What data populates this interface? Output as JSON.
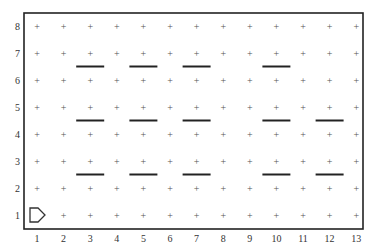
{
  "diagram": {
    "type": "grid-world",
    "columns": [
      1,
      2,
      3,
      4,
      5,
      6,
      7,
      8,
      9,
      10,
      11,
      12,
      13
    ],
    "rows": [
      1,
      2,
      3,
      4,
      5,
      6,
      7,
      8
    ],
    "grid_marker": "+",
    "colors": {
      "border": "#222222",
      "marker": "#555555",
      "wall": "#222222",
      "label": "#333333",
      "agent": "#333333",
      "background": "#ffffff"
    },
    "walls": [
      {
        "between_rows": [
          6,
          7
        ],
        "col": 3
      },
      {
        "between_rows": [
          6,
          7
        ],
        "col": 5
      },
      {
        "between_rows": [
          6,
          7
        ],
        "col": 7
      },
      {
        "between_rows": [
          6,
          7
        ],
        "col": 10
      },
      {
        "between_rows": [
          4,
          5
        ],
        "col": 3
      },
      {
        "between_rows": [
          4,
          5
        ],
        "col": 5
      },
      {
        "between_rows": [
          4,
          5
        ],
        "col": 7
      },
      {
        "between_rows": [
          4,
          5
        ],
        "col": 10
      },
      {
        "between_rows": [
          4,
          5
        ],
        "col": 12
      },
      {
        "between_rows": [
          2,
          3
        ],
        "col": 3
      },
      {
        "between_rows": [
          2,
          3
        ],
        "col": 5
      },
      {
        "between_rows": [
          2,
          3
        ],
        "col": 7
      },
      {
        "between_rows": [
          2,
          3
        ],
        "col": 10
      },
      {
        "between_rows": [
          2,
          3
        ],
        "col": 12
      }
    ],
    "agent": {
      "shape": "pentagon-arrow",
      "icon": "agent-arrow-icon",
      "col": 1,
      "row": 1,
      "facing": "right"
    }
  }
}
